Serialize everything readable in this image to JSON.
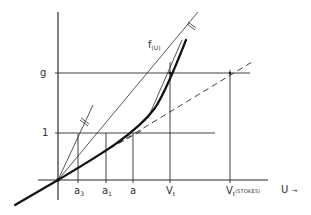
{
  "diagram": {
    "type": "velocity-function construction",
    "y_axis": {
      "ticks": [
        {
          "label": "g",
          "value": "g"
        },
        {
          "label": "1",
          "value": 1
        }
      ]
    },
    "x_axis": {
      "label": "U",
      "arrow": "→",
      "ticks": [
        {
          "main": "a",
          "sub": "3"
        },
        {
          "main": "a",
          "sub": "1"
        },
        {
          "main": "a",
          "sub": ""
        },
        {
          "main": "V",
          "sub": "t"
        },
        {
          "main": "V",
          "sub": "t",
          "note": "(STOKES)"
        }
      ]
    },
    "curve_label": {
      "main": "f",
      "sub": "(U)"
    },
    "colors": {
      "line": "#2a2a2a",
      "curve": "#111111",
      "text": "#333333",
      "background": "#ffffff"
    }
  }
}
